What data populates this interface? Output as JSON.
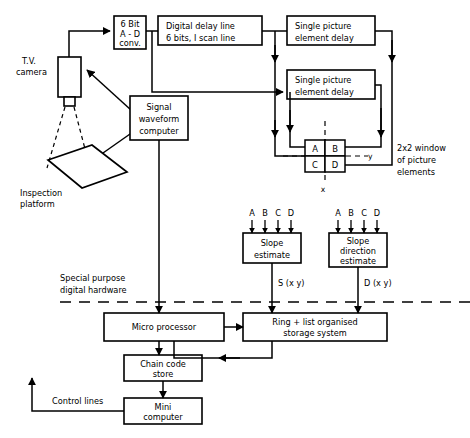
{
  "diagram": {
    "blocks": {
      "tv_camera": "T.V.\ncamera",
      "tv_camera_line1": "T.V.",
      "tv_camera_line2": "camera",
      "inspection_platform_line1": "Inspection",
      "inspection_platform_line2": "platform",
      "adc_line1": "6 Bit",
      "adc_line2": "A - D",
      "adc_line3": "conv.",
      "delay_line_line1": "Digital  delay line",
      "delay_line_line2": "6 bits,  I scan line",
      "single_delay_1_line1": "Single  picture",
      "single_delay_1_line2": "element delay",
      "single_delay_2_line1": "Single  picture",
      "single_delay_2_line2": "element delay",
      "signal_waveform_line1": "Signal",
      "signal_waveform_line2": "waveform",
      "signal_waveform_line3": "computer",
      "slope_estimate_line1": "Slope",
      "slope_estimate_line2": "estimate",
      "slope_direction_line1": "Slope",
      "slope_direction_line2": "direction",
      "slope_direction_line3": "estimate",
      "micro_processor": "Micro    processor",
      "storage_line1": "Ring + list  organised",
      "storage_line2": "storage  system",
      "chain_code_line1": "Chain   code",
      "chain_code_line2": "store",
      "mini_computer_line1": "Mini",
      "mini_computer_line2": "computer"
    },
    "window": {
      "caption_line1": "2x2 window",
      "caption_line2": "of picture",
      "caption_line3": "elements",
      "cell_a": "A",
      "cell_b": "B",
      "cell_c": "C",
      "cell_d": "D",
      "axis_x": "x",
      "axis_y": "y"
    },
    "annotations": {
      "special_purpose_line1": "Special  purpose",
      "special_purpose_line2": "digital  hardware",
      "control_lines": "Control  lines",
      "signal_s": "S (x y)",
      "signal_d": "D (x y)"
    },
    "input_labels": {
      "a": "A",
      "b": "B",
      "c": "C",
      "d": "D"
    },
    "colors": {
      "ink": "#000000",
      "paper": "#ffffff"
    }
  }
}
